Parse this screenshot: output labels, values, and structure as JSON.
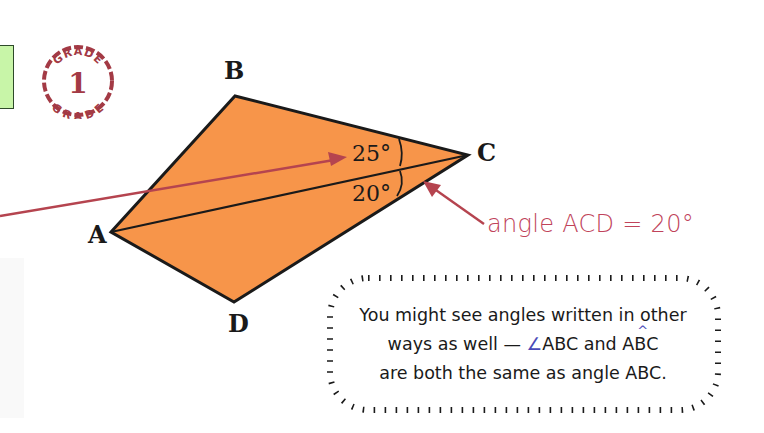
{
  "badge": {
    "top_text": "GRADE",
    "number": "1",
    "bottom_text": "GRADE",
    "color": "#a33a45"
  },
  "diagram": {
    "shape_fill": "#f7954a",
    "outline": "#1a1a1a",
    "arrow_color": "#b5444f",
    "vertices": {
      "A": {
        "label": "A",
        "x": 111,
        "y": 232
      },
      "B": {
        "label": "B",
        "x": 235,
        "y": 96
      },
      "C": {
        "label": "C",
        "x": 468,
        "y": 155
      },
      "D": {
        "label": "D",
        "x": 234,
        "y": 302
      }
    },
    "angles": [
      {
        "label": "25°",
        "name": "angle BCA"
      },
      {
        "label": "20°",
        "name": "angle ACD"
      }
    ]
  },
  "annotation": {
    "text": "angle ACD = 20°"
  },
  "tip": {
    "line1": "You might see angles written in other",
    "line2_pre": "ways as well — ",
    "line2_symbol": "∠",
    "line2_mid": "ABC and A",
    "line2_hat_letter": "B",
    "line2_post": "C",
    "line3": "are both the same as angle ABC."
  }
}
